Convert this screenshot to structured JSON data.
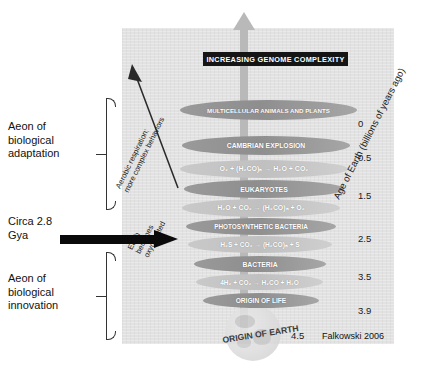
{
  "figure": {
    "title_banner": "INCREASING GENOME COMPLEXITY",
    "credit": "Falkowski 2006",
    "origin_of_earth_label": "ORIGIN OF EARTH",
    "origin_of_earth_value": "4.5"
  },
  "left_labels": {
    "aeon_adaptation": "Aeon of\nbiological\nadaptation",
    "circa": "Circa 2.8\nGya",
    "aeon_innovation": "Aeon of\nbiological\ninnovation"
  },
  "diagonal_captions": {
    "aerobic": "Aerobic respiration;\nmore complex behaviors",
    "oxygenated": "Earth\nbecomes\noxygenated"
  },
  "axis": {
    "title": "Age of Earth (billions of years ago)",
    "ticks": [
      {
        "value": "0",
        "top": 118
      },
      {
        "value": "0.5",
        "top": 152
      },
      {
        "value": "1.5",
        "top": 190
      },
      {
        "value": "2.5",
        "top": 233
      },
      {
        "value": "3.5",
        "top": 271
      },
      {
        "value": "3.9",
        "top": 305
      }
    ]
  },
  "bands": [
    {
      "label": "MULTICELLULAR ANIMALS AND PLANTS",
      "shade": "dark",
      "left": 180,
      "top": 100,
      "width": 177,
      "height": 20,
      "font": 6.2
    },
    {
      "label": "CAMBRIAN EXPLOSION",
      "shade": "dark",
      "left": 182,
      "top": 136,
      "width": 168,
      "height": 19,
      "font": 6.8
    },
    {
      "label": "O₂ + (H₂CO)ₙ → H₂O + CO₂",
      "shade": "light",
      "left": 180,
      "top": 160,
      "width": 168,
      "height": 18,
      "font": 7.0
    },
    {
      "label": "EUKARYOTES",
      "shade": "dark",
      "left": 184,
      "top": 180,
      "width": 160,
      "height": 18,
      "font": 6.9
    },
    {
      "label": "H₂O + CO₂ → (H₂CO)ₙ + O₂",
      "shade": "light",
      "left": 182,
      "top": 199,
      "width": 158,
      "height": 18,
      "font": 6.9
    },
    {
      "label": "PHOTOSYNTHETIC BACTERIA",
      "shade": "dark",
      "left": 186,
      "top": 218,
      "width": 150,
      "height": 17,
      "font": 6.4
    },
    {
      "label": "H₂S + CO₂ → (H₂CO)ₙ + S",
      "shade": "light",
      "left": 188,
      "top": 236,
      "width": 144,
      "height": 17,
      "font": 6.6
    },
    {
      "label": "BACTERIA",
      "shade": "dark",
      "left": 194,
      "top": 256,
      "width": 132,
      "height": 16,
      "font": 6.8
    },
    {
      "label": "4H₂ + CO₂ → H₂CO + H₂O",
      "shade": "light",
      "left": 196,
      "top": 274,
      "width": 127,
      "height": 16,
      "font": 6.5
    },
    {
      "label": "ORIGIN OF LIFE",
      "shade": "dark",
      "left": 203,
      "top": 293,
      "width": 116,
      "height": 15,
      "font": 6.6
    }
  ],
  "brackets": {
    "adaptation": {
      "top": 98,
      "height": 112
    },
    "innovation": {
      "top": 252,
      "height": 88
    }
  }
}
